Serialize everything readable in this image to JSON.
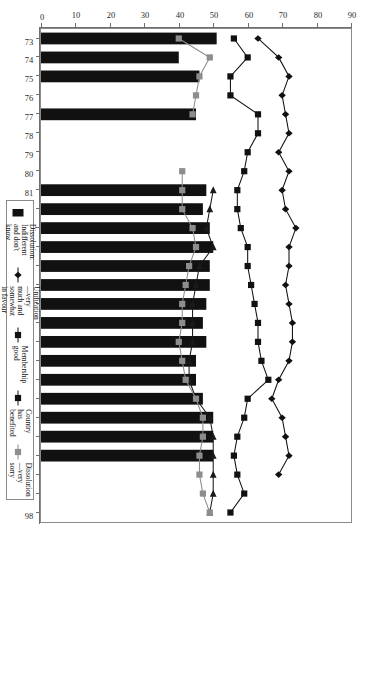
{
  "chart_data": {
    "type": "bar",
    "title": "",
    "xlabel": "",
    "ylabel": "",
    "orientation": "rotated-90",
    "grid": false,
    "legend_position": "top-right-boxed",
    "categories": [
      "73",
      "74",
      "75",
      "76",
      "77",
      "78",
      "79",
      "80",
      "81",
      "82",
      "83",
      "84",
      "85",
      "86",
      "87",
      "88",
      "89",
      "90",
      "91",
      "92",
      "93",
      "94",
      "95",
      "96",
      "97",
      "98"
    ],
    "ylim": [
      0,
      90
    ],
    "yticks": [
      0,
      10,
      20,
      30,
      40,
      50,
      60,
      70,
      80,
      90
    ],
    "xticks": [
      "73",
      "74",
      "75",
      "76",
      "77",
      "78",
      "79",
      "80",
      "81",
      "82",
      "83",
      "84",
      "85",
      "86",
      "87",
      "88",
      "89",
      "90",
      "91",
      "92",
      "93",
      "94",
      "95",
      "96",
      "97",
      "98"
    ],
    "series": [
      {
        "name": "Dissolution: Indifferent and don't know",
        "marker": "filled-rectangle",
        "kind": "bar",
        "color": "#111111",
        "values": [
          51,
          40,
          46,
          null,
          45,
          null,
          null,
          null,
          48,
          47,
          49,
          50,
          49,
          49,
          48,
          47,
          48,
          45,
          45,
          47,
          50,
          50,
          50,
          null,
          null,
          null
        ]
      },
      {
        "name": "Unification—very much and somewhat in favour",
        "marker": "triangle-left",
        "kind": "line",
        "color": "#1a1a1a",
        "values": [
          null,
          null,
          null,
          null,
          null,
          null,
          null,
          null,
          50,
          49,
          48,
          50,
          46,
          45,
          44,
          44,
          44,
          43,
          43,
          45,
          49,
          50,
          50,
          50,
          50,
          49
        ]
      },
      {
        "name": "Membership good",
        "marker": "filled-square",
        "kind": "line",
        "color": "#111111",
        "values": [
          56,
          60,
          55,
          55,
          63,
          63,
          60,
          59,
          57,
          57,
          58,
          60,
          60,
          61,
          62,
          63,
          63,
          64,
          66,
          60,
          59,
          57,
          56,
          57,
          59,
          55
        ]
      },
      {
        "name": "Country has benefited",
        "marker": "filled-diamond",
        "kind": "line",
        "color": "#111111",
        "values": [
          63,
          69,
          72,
          70,
          71,
          72,
          69,
          72,
          70,
          71,
          74,
          72,
          72,
          71,
          72,
          73,
          73,
          72,
          69,
          67,
          70,
          71,
          72,
          69,
          null,
          null
        ]
      },
      {
        "name": "Dissolution—very sorry",
        "marker": "grey-square",
        "kind": "line",
        "color": "#8d8d8d",
        "values": [
          40,
          49,
          46,
          45,
          44,
          null,
          null,
          41,
          41,
          41,
          44,
          45,
          43,
          42,
          41,
          41,
          40,
          41,
          42,
          45,
          47,
          47,
          46,
          46,
          47,
          49
        ]
      }
    ],
    "legend": [
      {
        "label": "Dissolution: Indifferent and don't know",
        "marker": "filled-rectangle",
        "color": "#111111"
      },
      {
        "label": "Unification—very much and somewhat in favour",
        "marker": "filled-diamond",
        "color": "#111111"
      },
      {
        "label": "Membership good",
        "marker": "filled-square",
        "color": "#111111"
      },
      {
        "label": "Country has benefited",
        "marker": "plus-square",
        "color": "#111111"
      },
      {
        "label": "Dissolution—very sorry",
        "marker": "grey-square",
        "color": "#8d8d8d"
      }
    ]
  }
}
